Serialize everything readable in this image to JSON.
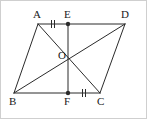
{
  "figure": {
    "background_color": "#ffffff",
    "line_color": "#2b2b2b",
    "label_color": "#1a1a1a",
    "border_color": "#cfcfcf",
    "points": {
      "A": {
        "label": "A",
        "x": 38,
        "y": 24,
        "label_x": 33,
        "label_y": 18,
        "dot": false
      },
      "B": {
        "label": "B",
        "x": 14,
        "y": 93,
        "label_x": 9,
        "label_y": 105,
        "dot": false
      },
      "C": {
        "label": "C",
        "x": 100,
        "y": 93,
        "label_x": 97,
        "label_y": 105,
        "dot": false
      },
      "D": {
        "label": "D",
        "x": 125,
        "y": 24,
        "label_x": 121,
        "label_y": 18,
        "dot": false
      },
      "E": {
        "label": "E",
        "x": 68,
        "y": 24,
        "label_x": 64,
        "label_y": 18,
        "dot": true
      },
      "F": {
        "label": "F",
        "x": 68,
        "y": 93,
        "label_x": 64,
        "label_y": 105,
        "dot": true
      },
      "O": {
        "label": "O",
        "x": 69,
        "y": 59,
        "label_x": 58,
        "label_y": 59,
        "dot": false
      }
    },
    "segments": [
      {
        "name": "side-AD",
        "from": "A",
        "to": "D"
      },
      {
        "name": "side-AB",
        "from": "A",
        "to": "B"
      },
      {
        "name": "side-BC",
        "from": "B",
        "to": "C"
      },
      {
        "name": "side-DC",
        "from": "D",
        "to": "C"
      },
      {
        "name": "diagonal-AC",
        "from": "A",
        "to": "C"
      },
      {
        "name": "diagonal-BD",
        "from": "B",
        "to": "D"
      },
      {
        "name": "segment-EF",
        "from": "E",
        "to": "F"
      }
    ],
    "tick_marks": [
      {
        "name": "tick-AE",
        "x": 53,
        "y": 24,
        "count": 2
      },
      {
        "name": "tick-FC",
        "x": 84,
        "y": 93,
        "count": 2
      }
    ]
  }
}
